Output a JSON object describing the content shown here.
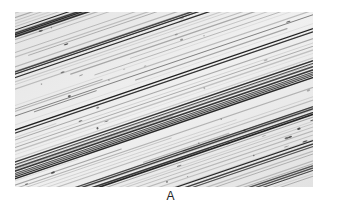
{
  "figure": {
    "caption_label": "A",
    "image_description": "Micrograph of a metal surface showing parallel diagonal scratch striations (abrasion/polishing marks) rising from lower-left to upper-right",
    "colors": {
      "background": "#ffffff",
      "surface_light": "#ececec",
      "streak_dark": "#1e1e1e",
      "streak_mid": "#6a6a6a",
      "caption_text": "#222222"
    }
  }
}
